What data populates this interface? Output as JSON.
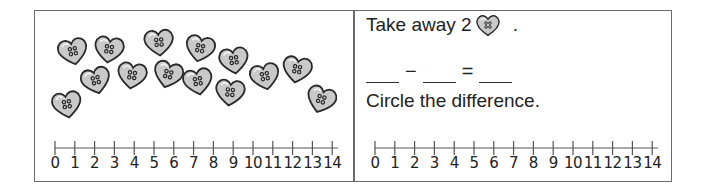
{
  "worksheet": {
    "left_panel": {
      "hearts": [
        {
          "x": 22,
          "y": 27,
          "rot": -12
        },
        {
          "x": 58,
          "y": 25,
          "rot": 8
        },
        {
          "x": 108,
          "y": 18,
          "rot": -5
        },
        {
          "x": 149,
          "y": 24,
          "rot": 12
        },
        {
          "x": 183,
          "y": 36,
          "rot": -8
        },
        {
          "x": 246,
          "y": 45,
          "rot": 10
        },
        {
          "x": 45,
          "y": 56,
          "rot": -15
        },
        {
          "x": 81,
          "y": 51,
          "rot": 8
        },
        {
          "x": 117,
          "y": 50,
          "rot": 15
        },
        {
          "x": 147,
          "y": 57,
          "rot": -10
        },
        {
          "x": 179,
          "y": 68,
          "rot": 6
        },
        {
          "x": 214,
          "y": 52,
          "rot": -12
        },
        {
          "x": 16,
          "y": 80,
          "rot": -10
        },
        {
          "x": 270,
          "y": 75,
          "rot": 18
        }
      ],
      "number_line": {
        "min": 0,
        "max": 14,
        "labels": [
          "0",
          "1",
          "2",
          "3",
          "4",
          "5",
          "6",
          "7",
          "8",
          "9",
          "10",
          "11",
          "12",
          "13",
          "14"
        ]
      }
    },
    "right_panel": {
      "instruction_prefix": "Take away 2",
      "instruction_suffix": ".",
      "equation": {
        "minus": "−",
        "equals": "="
      },
      "prompt": "Circle the difference.",
      "number_line": {
        "min": 0,
        "max": 14,
        "labels": [
          "0",
          "1",
          "2",
          "3",
          "4",
          "5",
          "6",
          "7",
          "8",
          "9",
          "10",
          "11",
          "12",
          "13",
          "14"
        ]
      }
    },
    "colors": {
      "border": "#6a6a6a",
      "heart_fill": "#c9c9c9",
      "heart_stroke": "#2a2a2a",
      "text": "#222222"
    }
  }
}
